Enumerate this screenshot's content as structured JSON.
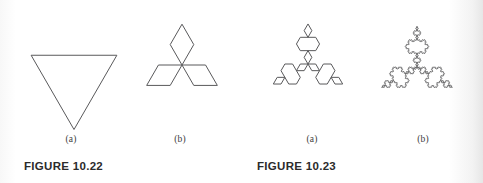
{
  "page": {
    "background_color": "#ffffff",
    "stroke_color": "#59595b",
    "text_color": "#2b2b2b",
    "sublabel_color": "#3c3c3c",
    "width": 483,
    "height": 183
  },
  "figures": [
    {
      "caption": "FIGURE 10.22",
      "caption_x": 24,
      "caption_y": 160,
      "panels": [
        {
          "sublabel": "(a)",
          "shape_name": "koch-snowflake-iteration-0-triangle",
          "koch_iterations": 0,
          "orientation": "down",
          "x": 24,
          "y": 30,
          "size": 100,
          "label_x": 71,
          "label_y": 134
        },
        {
          "sublabel": "(b)",
          "shape_name": "koch-snowflake-iteration-1-star",
          "koch_iterations": 1,
          "orientation": "up",
          "x": 129,
          "y": 12,
          "size": 106,
          "label_x": 180,
          "label_y": 134
        }
      ]
    },
    {
      "caption": "FIGURE 10.23",
      "caption_x": 257,
      "caption_y": 160,
      "panels": [
        {
          "sublabel": "(a)",
          "shape_name": "koch-snowflake-iteration-2",
          "koch_iterations": 2,
          "orientation": "up",
          "x": 256,
          "y": 12,
          "size": 104,
          "label_x": 312,
          "label_y": 134
        },
        {
          "sublabel": "(b)",
          "shape_name": "koch-snowflake-iteration-4",
          "koch_iterations": 4,
          "orientation": "up",
          "x": 364,
          "y": 14,
          "size": 106,
          "label_x": 423,
          "label_y": 134
        }
      ]
    }
  ]
}
